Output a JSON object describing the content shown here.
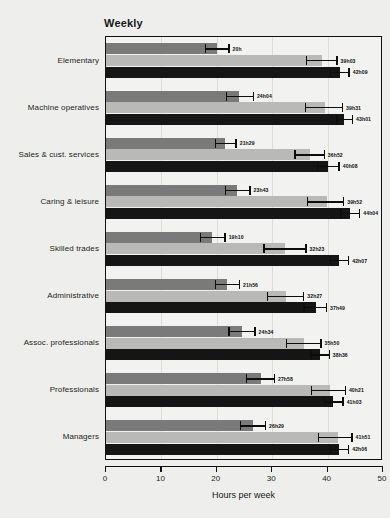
{
  "chart_data": {
    "type": "bar",
    "orientation": "horizontal",
    "title": "Weekly",
    "xlabel": "Hours per week",
    "ylabel": "",
    "xlim": [
      0,
      50
    ],
    "xticks": [
      0,
      10,
      20,
      30,
      40,
      50
    ],
    "grid": true,
    "grid_axis": "x",
    "legend": null,
    "categories": [
      "Elementary",
      "Machine operatives",
      "Sales & cust. services",
      "Caring & leisure",
      "Skilled trades",
      "Administrative",
      "Assoc. professionals",
      "Professionals",
      "Managers"
    ],
    "series": [
      {
        "name": "series-1",
        "color": "#7a7a7a",
        "values": [
          20.0,
          24.07,
          21.48,
          23.72,
          19.17,
          21.93,
          24.57,
          27.97,
          26.48
        ],
        "labels": [
          "20h",
          "24h04",
          "21h29",
          "23h43",
          "19h10",
          "21h56",
          "24h34",
          "27h58",
          "26h29"
        ],
        "err_low": [
          17.9,
          21.6,
          19.6,
          21.5,
          16.9,
          19.7,
          22.1,
          25.3,
          24.1
        ],
        "err_high": [
          22.3,
          26.7,
          23.6,
          26.1,
          21.6,
          24.2,
          27.0,
          30.5,
          28.9
        ]
      },
      {
        "name": "series-2",
        "color": "#b9b9b7",
        "values": [
          39.05,
          39.52,
          36.87,
          39.87,
          32.38,
          32.45,
          35.83,
          40.35,
          41.85
        ],
        "labels": [
          "39h03",
          "39h31",
          "36h52",
          "39h52",
          "32h23",
          "32h27",
          "35h50",
          "40h21",
          "41h51"
        ],
        "err_low": [
          36.1,
          35.9,
          34.0,
          36.3,
          28.4,
          29.0,
          32.5,
          37.0,
          38.3
        ],
        "err_high": [
          41.8,
          42.8,
          39.5,
          43.0,
          36.2,
          35.8,
          38.9,
          43.3,
          44.5
        ]
      },
      {
        "name": "series-3",
        "color": "#151515",
        "values": [
          42.15,
          43.02,
          40.13,
          44.07,
          42.12,
          37.82,
          38.6,
          41.05,
          42.1
        ],
        "labels": [
          "42h09",
          "43h01",
          "40h08",
          "44h04",
          "42h07",
          "37h49",
          "38h36",
          "41h03",
          "42h06"
        ],
        "err_low": [
          40.4,
          41.6,
          38.1,
          42.3,
          40.4,
          35.6,
          36.9,
          39.3,
          40.4
        ],
        "err_high": [
          44.0,
          44.6,
          42.2,
          45.9,
          43.9,
          39.9,
          40.4,
          42.9,
          43.9
        ]
      }
    ]
  }
}
